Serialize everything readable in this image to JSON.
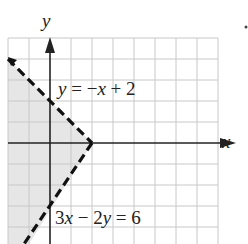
{
  "figure": {
    "axis_labels": {
      "x": "x",
      "y": "y"
    },
    "grid": {
      "x_min": -2,
      "x_max": 8,
      "y_min": -4,
      "y_max": 5,
      "unit_px": 21,
      "origin_px": [
        50,
        143
      ],
      "left_px": 8,
      "right_px": 218,
      "top_px": 38,
      "bottom_px": 244,
      "grid_color": "#c8c8c8"
    },
    "lines": [
      {
        "label": "y = −x + 2",
        "equation": "y = -x + 2",
        "style": "dashed",
        "points": [
          [
            -2,
            4
          ],
          [
            2,
            0
          ]
        ]
      },
      {
        "label": "3x − 2y = 6",
        "equation": "3x - 2y = 6",
        "style": "dashed",
        "points": [
          [
            2,
            0
          ],
          [
            -1,
            -4.5
          ]
        ]
      }
    ],
    "shaded_region": {
      "description": "y < -x + 2 and 3x - 2y < 6",
      "color": "#e6e6e6"
    },
    "labels": {
      "line1": {
        "prefix": "y",
        "eq": " = −",
        "var": "x",
        "rest": " + 2"
      },
      "line2": {
        "coef1": "3",
        "var1": "x",
        "op": " − 2",
        "var2": "y",
        "rest": " = 6"
      }
    },
    "colors": {
      "axis": "#222222",
      "dash": "#111111",
      "shade": "#e6e6e6",
      "grid": "#c8c8c8"
    }
  }
}
